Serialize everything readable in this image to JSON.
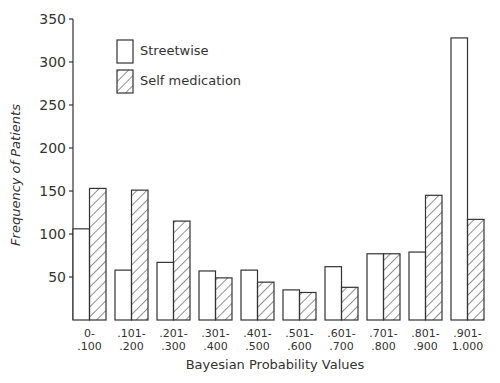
{
  "chart_data": {
    "type": "bar",
    "title": "",
    "xlabel": "Bayesian Probability Values",
    "ylabel": "Frequency of Patients",
    "ylim": [
      0,
      350
    ],
    "yticks": [
      50,
      100,
      150,
      200,
      250,
      300,
      350
    ],
    "grid": false,
    "legend_position": "upper-left",
    "categories": [
      "0-\n.100",
      ".101-\n.200",
      ".201-\n.300",
      ".301-\n.400",
      ".401-\n.500",
      ".501-\n.600",
      ".601-\n.700",
      ".701-\n.800",
      ".801-\n.900",
      ".901-\n1.000"
    ],
    "category_lines": [
      [
        "0-",
        ".100"
      ],
      [
        ".101-",
        ".200"
      ],
      [
        ".201-",
        ".300"
      ],
      [
        ".301-",
        ".400"
      ],
      [
        ".401-",
        ".500"
      ],
      [
        ".501-",
        ".600"
      ],
      [
        ".601-",
        ".700"
      ],
      [
        ".701-",
        ".800"
      ],
      [
        ".801-",
        ".900"
      ],
      [
        ".901-",
        "1.000"
      ]
    ],
    "series": [
      {
        "name": "Streetwise",
        "pattern": "open",
        "values": [
          106,
          58,
          67,
          57,
          58,
          35,
          62,
          77,
          79,
          328
        ]
      },
      {
        "name": "Self medication",
        "pattern": "hatched",
        "values": [
          153,
          151,
          115,
          49,
          44,
          32,
          38,
          77,
          145,
          117
        ]
      }
    ]
  },
  "legend": {
    "items": [
      {
        "label": "Streetwise",
        "pattern": "open"
      },
      {
        "label": "Self medication",
        "pattern": "hatched"
      }
    ]
  },
  "axes": {
    "x_title": "Bayesian Probability Values",
    "y_title": "Frequency of Patients"
  },
  "colors": {
    "line": "#333333",
    "background": "#ffffff"
  }
}
